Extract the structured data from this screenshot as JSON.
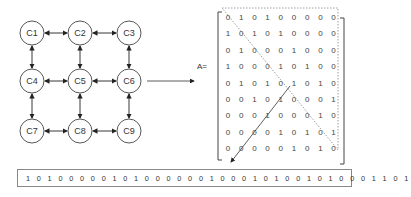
{
  "graph": {
    "nodes": [
      {
        "id": "C1",
        "x": 32,
        "y": 33
      },
      {
        "id": "C2",
        "x": 80,
        "y": 33
      },
      {
        "id": "C3",
        "x": 129,
        "y": 33
      },
      {
        "id": "C4",
        "x": 32,
        "y": 81
      },
      {
        "id": "C5",
        "x": 80,
        "y": 81
      },
      {
        "id": "C6",
        "x": 129,
        "y": 81
      },
      {
        "id": "C7",
        "x": 32,
        "y": 131
      },
      {
        "id": "C8",
        "x": 80,
        "y": 131
      },
      {
        "id": "C9",
        "x": 129,
        "y": 131
      }
    ],
    "edges": [
      [
        "C1",
        "C2"
      ],
      [
        "C2",
        "C3"
      ],
      [
        "C4",
        "C5"
      ],
      [
        "C5",
        "C6"
      ],
      [
        "C7",
        "C8"
      ],
      [
        "C8",
        "C9"
      ],
      [
        "C1",
        "C4"
      ],
      [
        "C4",
        "C7"
      ],
      [
        "C2",
        "C5"
      ],
      [
        "C5",
        "C8"
      ],
      [
        "C3",
        "C6"
      ],
      [
        "C6",
        "C9"
      ]
    ]
  },
  "matrix": {
    "label": "A=",
    "rows": [
      [
        0,
        1,
        0,
        1,
        0,
        0,
        0,
        0,
        0
      ],
      [
        1,
        0,
        1,
        0,
        1,
        0,
        0,
        0,
        0
      ],
      [
        0,
        1,
        0,
        0,
        0,
        1,
        0,
        0,
        0
      ],
      [
        1,
        0,
        0,
        0,
        1,
        0,
        1,
        0,
        0
      ],
      [
        0,
        1,
        0,
        1,
        0,
        1,
        0,
        1,
        0
      ],
      [
        0,
        0,
        1,
        0,
        1,
        0,
        0,
        0,
        1
      ],
      [
        0,
        0,
        0,
        1,
        0,
        0,
        0,
        1,
        0
      ],
      [
        0,
        0,
        0,
        0,
        1,
        0,
        1,
        0,
        1
      ],
      [
        0,
        0,
        0,
        0,
        0,
        1,
        0,
        1,
        0
      ]
    ]
  },
  "bitstring": "101000001010000001000101001010001101",
  "colors": {
    "stroke": "#333333",
    "dotted": "#888888"
  }
}
